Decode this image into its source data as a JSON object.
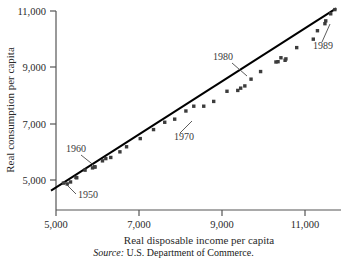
{
  "chart_data": {
    "type": "scatter",
    "title": "",
    "xlabel": "Real disposable income per capita",
    "ylabel": "Real consumption per capita",
    "xlim": [
      4600,
      11800
    ],
    "ylim": [
      4400,
      11200
    ],
    "xticks": [
      5000,
      7000,
      9000,
      11000
    ],
    "xticklabels": [
      "5,000",
      "7,000",
      "9,000",
      "11,000"
    ],
    "yticks": [
      5000,
      7000,
      9000,
      11000
    ],
    "yticklabels": [
      "5,000",
      "7,000",
      "9,000",
      "11,000"
    ],
    "grid": false,
    "legend": null,
    "marker": "square",
    "marker_color": "#3c3c3c",
    "line_color": "#000000",
    "fit_line": {
      "x": [
        4880,
        11750
      ],
      "y": [
        4620,
        11090
      ]
    },
    "points": [
      {
        "year": 1950,
        "x": 5180,
        "y": 4890
      },
      {
        "year": 1951,
        "x": 5270,
        "y": 4860
      },
      {
        "year": 1952,
        "x": 5350,
        "y": 4930
      },
      {
        "year": 1953,
        "x": 5500,
        "y": 5080
      },
      {
        "year": 1954,
        "x": 5480,
        "y": 5090
      },
      {
        "year": 1955,
        "x": 5700,
        "y": 5350
      },
      {
        "year": 1956,
        "x": 5880,
        "y": 5430
      },
      {
        "year": 1957,
        "x": 5930,
        "y": 5470
      },
      {
        "year": 1958,
        "x": 5940,
        "y": 5460
      },
      {
        "year": 1959,
        "x": 6120,
        "y": 5680
      },
      {
        "year": 1960,
        "x": 6200,
        "y": 5760
      },
      {
        "year": 1961,
        "x": 6320,
        "y": 5800
      },
      {
        "year": 1962,
        "x": 6540,
        "y": 6000
      },
      {
        "year": 1963,
        "x": 6700,
        "y": 6180
      },
      {
        "year": 1964,
        "x": 7030,
        "y": 6470
      },
      {
        "year": 1965,
        "x": 7350,
        "y": 6790
      },
      {
        "year": 1966,
        "x": 7620,
        "y": 7050
      },
      {
        "year": 1967,
        "x": 7860,
        "y": 7160
      },
      {
        "year": 1968,
        "x": 8130,
        "y": 7450
      },
      {
        "year": 1969,
        "x": 8320,
        "y": 7620
      },
      {
        "year": 1970,
        "x": 8560,
        "y": 7620
      },
      {
        "year": 1971,
        "x": 8800,
        "y": 7790
      },
      {
        "year": 1972,
        "x": 9120,
        "y": 8150
      },
      {
        "year": 1973,
        "x": 9550,
        "y": 8340
      },
      {
        "year": 1974,
        "x": 9380,
        "y": 8180
      },
      {
        "year": 1975,
        "x": 9450,
        "y": 8260
      },
      {
        "year": 1976,
        "x": 9700,
        "y": 8580
      },
      {
        "year": 1977,
        "x": 9930,
        "y": 8850
      },
      {
        "year": 1978,
        "x": 10300,
        "y": 9190
      },
      {
        "year": 1979,
        "x": 10420,
        "y": 9340
      },
      {
        "year": 1980,
        "x": 10350,
        "y": 9200
      },
      {
        "year": 1981,
        "x": 10520,
        "y": 9250
      },
      {
        "year": 1982,
        "x": 10540,
        "y": 9300
      },
      {
        "year": 1983,
        "x": 10800,
        "y": 9700
      },
      {
        "year": 1984,
        "x": 11200,
        "y": 10000
      },
      {
        "year": 1985,
        "x": 11300,
        "y": 10300
      },
      {
        "year": 1986,
        "x": 11480,
        "y": 10550
      },
      {
        "year": 1987,
        "x": 11500,
        "y": 10650
      },
      {
        "year": 1988,
        "x": 11620,
        "y": 10900
      },
      {
        "year": 1989,
        "x": 11720,
        "y": 11050
      }
    ],
    "annotations": [
      {
        "label": "1950",
        "label_x": 78,
        "label_y": 198,
        "leader": [
          [
            76,
            194
          ],
          [
            64,
            182
          ]
        ]
      },
      {
        "label": "1960",
        "label_x": 66,
        "label_y": 152,
        "leader": [
          [
            81,
            155
          ],
          [
            96,
            167
          ]
        ]
      },
      {
        "label": "1970",
        "label_x": 174,
        "label_y": 140,
        "leader": [
          [
            180,
            133
          ],
          [
            192,
            121
          ]
        ]
      },
      {
        "label": "1980",
        "label_x": 213,
        "label_y": 60,
        "leader": [
          [
            232,
            63
          ],
          [
            247,
            76
          ]
        ]
      },
      {
        "label": "1989",
        "label_x": 313,
        "label_y": 49,
        "leader": [
          [
            322,
            42
          ],
          [
            330,
            24
          ]
        ]
      }
    ]
  },
  "source": {
    "prefix": "Source:",
    "text": "U.S. Department of Commerce."
  }
}
